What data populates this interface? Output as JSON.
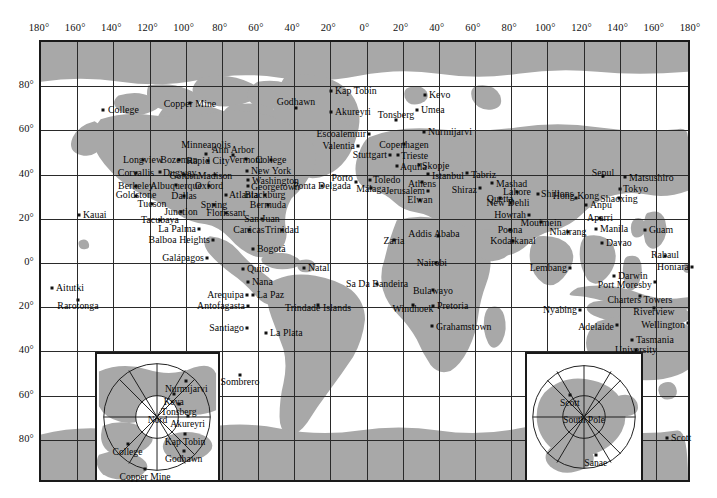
{
  "map": {
    "title": "World map of geophysical observatory stations",
    "projection": "cylindrical-equirectangular",
    "colors": {
      "land": "#a8a8a8",
      "ocean": "#ffffff",
      "grid": "#2a2a2a",
      "frame": "#1a1a1a",
      "text": "#050505"
    },
    "frame": {
      "x": 39,
      "y": 40,
      "width": 651,
      "height": 442
    },
    "longitude_ticks": [
      "180°",
      "160°",
      "140°",
      "120°",
      "100°",
      "80°",
      "60°",
      "40°",
      "20°",
      "0°",
      "20°",
      "40°",
      "60°",
      "80°",
      "100°",
      "120°",
      "140°",
      "160°",
      "180°"
    ],
    "latitude_ticks": [
      "80°",
      "60°",
      "40°",
      "20°",
      "0°",
      "20°",
      "40°",
      "60°",
      "80°"
    ],
    "grid_spacing_degrees": {
      "longitude": 20,
      "latitude": 20
    }
  },
  "stations": [
    {
      "name": "College",
      "x": 103,
      "y": 110,
      "lx": 108,
      "ly": 110,
      "align": "l"
    },
    {
      "name": "Copper Mine",
      "x": 190,
      "y": 103,
      "lx": 190,
      "ly": 104,
      "align": "c"
    },
    {
      "name": "Godhawn",
      "x": 296,
      "y": 108,
      "lx": 296,
      "ly": 102,
      "align": "c"
    },
    {
      "name": "Kap Tobin",
      "x": 331,
      "y": 91,
      "lx": 335,
      "ly": 91,
      "align": "l"
    },
    {
      "name": "Akureyri",
      "x": 331,
      "y": 112,
      "lx": 335,
      "ly": 112,
      "align": "l"
    },
    {
      "name": "Tonsberg",
      "x": 396,
      "y": 120,
      "lx": 396,
      "ly": 115,
      "align": "c"
    },
    {
      "name": "Kevo",
      "x": 425,
      "y": 95,
      "lx": 429,
      "ly": 95,
      "align": "l"
    },
    {
      "name": "Umea",
      "x": 417,
      "y": 110,
      "lx": 421,
      "ly": 110,
      "align": "l"
    },
    {
      "name": "Escoalemuir",
      "x": 369,
      "y": 134,
      "lx": 366,
      "ly": 134,
      "align": "r"
    },
    {
      "name": "Nurmijarvi",
      "x": 424,
      "y": 132,
      "lx": 428,
      "ly": 132,
      "align": "l"
    },
    {
      "name": "Valentia",
      "x": 358,
      "y": 146,
      "lx": 355,
      "ly": 146,
      "align": "r"
    },
    {
      "name": "Copenhagen",
      "x": 404,
      "y": 144,
      "lx": 404,
      "ly": 145,
      "align": "c"
    },
    {
      "name": "Stuttgart",
      "x": 390,
      "y": 155,
      "lx": 387,
      "ly": 155,
      "align": "r"
    },
    {
      "name": "Trieste",
      "x": 398,
      "y": 155,
      "lx": 401,
      "ly": 156,
      "align": "l"
    },
    {
      "name": "Aquila",
      "x": 397,
      "y": 166,
      "lx": 400,
      "ly": 167,
      "align": "l"
    },
    {
      "name": "Skopje",
      "x": 419,
      "y": 165,
      "lx": 422,
      "ly": 166,
      "align": "l"
    },
    {
      "name": "Istanbul",
      "x": 428,
      "y": 174,
      "lx": 432,
      "ly": 176,
      "align": "l"
    },
    {
      "name": "Porto",
      "x": 356,
      "y": 182,
      "lx": 353,
      "ly": 178,
      "align": "r"
    },
    {
      "name": "Toledo",
      "x": 370,
      "y": 180,
      "lx": 373,
      "ly": 180,
      "align": "l"
    },
    {
      "name": "Ponta Delgada",
      "x": 322,
      "y": 186,
      "lx": 322,
      "ly": 186,
      "align": "c"
    },
    {
      "name": "Málaga",
      "x": 371,
      "y": 188,
      "lx": 371,
      "ly": 189,
      "align": "c"
    },
    {
      "name": "Athens",
      "x": 422,
      "y": 182,
      "lx": 422,
      "ly": 184,
      "align": "c"
    },
    {
      "name": "Jerusalem",
      "x": 428,
      "y": 191,
      "lx": 425,
      "ly": 191,
      "align": "r"
    },
    {
      "name": "Elwan",
      "x": 420,
      "y": 200,
      "lx": 420,
      "ly": 200,
      "align": "c"
    },
    {
      "name": "Tabriz",
      "x": 467,
      "y": 173,
      "lx": 471,
      "ly": 175,
      "align": "l"
    },
    {
      "name": "Shiraz",
      "x": 480,
      "y": 188,
      "lx": 477,
      "ly": 190,
      "align": "r"
    },
    {
      "name": "Mashad",
      "x": 492,
      "y": 183,
      "lx": 496,
      "ly": 184,
      "align": "l"
    },
    {
      "name": "Quetta",
      "x": 500,
      "y": 198,
      "lx": 500,
      "ly": 199,
      "align": "c"
    },
    {
      "name": "Lahore",
      "x": 517,
      "y": 192,
      "lx": 517,
      "ly": 192,
      "align": "c"
    },
    {
      "name": "New Dehli",
      "x": 511,
      "y": 203,
      "lx": 508,
      "ly": 203,
      "align": "c"
    },
    {
      "name": "Shillons",
      "x": 538,
      "y": 194,
      "lx": 541,
      "ly": 194,
      "align": "l"
    },
    {
      "name": "Howrah",
      "x": 529,
      "y": 215,
      "lx": 526,
      "ly": 215,
      "align": "r"
    },
    {
      "name": "Mouimein",
      "x": 541,
      "y": 222,
      "lx": 541,
      "ly": 223,
      "align": "c"
    },
    {
      "name": "Poona",
      "x": 510,
      "y": 230,
      "lx": 510,
      "ly": 230,
      "align": "c"
    },
    {
      "name": "Kodaikanal",
      "x": 513,
      "y": 241,
      "lx": 513,
      "ly": 241,
      "align": "c"
    },
    {
      "name": "Nhatrang",
      "x": 568,
      "y": 232,
      "lx": 568,
      "ly": 232,
      "align": "c"
    },
    {
      "name": "Hong Kong",
      "x": 576,
      "y": 198,
      "lx": 576,
      "ly": 196,
      "align": "c"
    },
    {
      "name": "Anpu",
      "x": 586,
      "y": 205,
      "lx": 590,
      "ly": 205,
      "align": "l"
    },
    {
      "name": "Sepul",
      "x": 603,
      "y": 176,
      "lx": 603,
      "ly": 173,
      "align": "c"
    },
    {
      "name": "Matsushiro",
      "x": 625,
      "y": 177,
      "lx": 629,
      "ly": 178,
      "align": "l"
    },
    {
      "name": "Tokyo",
      "x": 620,
      "y": 189,
      "lx": 623,
      "ly": 189,
      "align": "l"
    },
    {
      "name": "Shaoxing",
      "x": 619,
      "y": 198,
      "lx": 619,
      "ly": 199,
      "align": "c"
    },
    {
      "name": "Aparri",
      "x": 600,
      "y": 218,
      "lx": 600,
      "ly": 218,
      "align": "c"
    },
    {
      "name": "Manila",
      "x": 596,
      "y": 229,
      "lx": 600,
      "ly": 229,
      "align": "l"
    },
    {
      "name": "Davao",
      "x": 602,
      "y": 243,
      "lx": 606,
      "ly": 243,
      "align": "l"
    },
    {
      "name": "Guam",
      "x": 645,
      "y": 230,
      "lx": 649,
      "ly": 230,
      "align": "l"
    },
    {
      "name": "Rabaul",
      "x": 665,
      "y": 256,
      "lx": 665,
      "ly": 255,
      "align": "c"
    },
    {
      "name": "Honiara",
      "x": 692,
      "y": 267,
      "lx": 689,
      "ly": 267,
      "align": "r"
    },
    {
      "name": "Lembang",
      "x": 570,
      "y": 268,
      "lx": 567,
      "ly": 268,
      "align": "r"
    },
    {
      "name": "Darwin",
      "x": 614,
      "y": 276,
      "lx": 618,
      "ly": 276,
      "align": "l"
    },
    {
      "name": "Port Moresby",
      "x": 655,
      "y": 282,
      "lx": 652,
      "ly": 285,
      "align": "r"
    },
    {
      "name": "Charters Towers",
      "x": 640,
      "y": 296,
      "lx": 640,
      "ly": 300,
      "align": "c"
    },
    {
      "name": "Nyabing",
      "x": 580,
      "y": 310,
      "lx": 577,
      "ly": 310,
      "align": "r"
    },
    {
      "name": "Riverview",
      "x": 654,
      "y": 308,
      "lx": 654,
      "ly": 312,
      "align": "c"
    },
    {
      "name": "Adelaide",
      "x": 617,
      "y": 325,
      "lx": 614,
      "ly": 327,
      "align": "r"
    },
    {
      "name": "Wellington",
      "x": 688,
      "y": 323,
      "lx": 685,
      "ly": 325,
      "align": "r"
    },
    {
      "name": "Tasmania",
      "x": 632,
      "y": 340,
      "lx": 636,
      "ly": 340,
      "align": "l"
    },
    {
      "name": "University",
      "x": 636,
      "y": 350,
      "lx": 636,
      "ly": 350,
      "align": "c"
    },
    {
      "name": "Minneapolis",
      "x": 206,
      "y": 154,
      "lx": 206,
      "ly": 145,
      "align": "c"
    },
    {
      "name": "Ann Arbor",
      "x": 233,
      "y": 155,
      "lx": 233,
      "ly": 150,
      "align": "c"
    },
    {
      "name": "Longview",
      "x": 143,
      "y": 160,
      "lx": 143,
      "ly": 160,
      "align": "c"
    },
    {
      "name": "Bozeman",
      "x": 179,
      "y": 160,
      "lx": 179,
      "ly": 160,
      "align": "c"
    },
    {
      "name": "Rapid City",
      "x": 208,
      "y": 161,
      "lx": 208,
      "ly": 161,
      "align": "c"
    },
    {
      "name": "Vermont",
      "x": 246,
      "y": 159,
      "lx": 246,
      "ly": 160,
      "align": "c"
    },
    {
      "name": "College",
      "x": 271,
      "y": 160,
      "lx": 271,
      "ly": 160,
      "align": "c"
    },
    {
      "name": "Corvallis",
      "x": 136,
      "y": 173,
      "lx": 136,
      "ly": 173,
      "align": "c"
    },
    {
      "name": "Dugway",
      "x": 160,
      "y": 172,
      "lx": 163,
      "ly": 173,
      "align": "l"
    },
    {
      "name": "Golden",
      "x": 184,
      "y": 175,
      "lx": 184,
      "ly": 176,
      "align": "c"
    },
    {
      "name": "Madison",
      "x": 215,
      "y": 175,
      "lx": 215,
      "ly": 176,
      "align": "c"
    },
    {
      "name": "New York",
      "x": 247,
      "y": 171,
      "lx": 251,
      "ly": 171,
      "align": "l"
    },
    {
      "name": "Washington",
      "x": 248,
      "y": 180,
      "lx": 252,
      "ly": 181,
      "align": "l"
    },
    {
      "name": "Berkeley",
      "x": 136,
      "y": 186,
      "lx": 136,
      "ly": 186,
      "align": "c"
    },
    {
      "name": "Albuquerque",
      "x": 176,
      "y": 185,
      "lx": 176,
      "ly": 186,
      "align": "c"
    },
    {
      "name": "Oxford",
      "x": 209,
      "y": 186,
      "lx": 209,
      "ly": 186,
      "align": "c"
    },
    {
      "name": "Georgetown",
      "x": 248,
      "y": 186,
      "lx": 251,
      "ly": 187,
      "align": "l"
    },
    {
      "name": "Goldstone",
      "x": 136,
      "y": 196,
      "lx": 136,
      "ly": 195,
      "align": "c"
    },
    {
      "name": "Dallas",
      "x": 184,
      "y": 196,
      "lx": 184,
      "ly": 196,
      "align": "c"
    },
    {
      "name": "Atlanta",
      "x": 226,
      "y": 195,
      "lx": 229,
      "ly": 195,
      "align": "l"
    },
    {
      "name": "Blackburg",
      "x": 265,
      "y": 195,
      "lx": 265,
      "ly": 195,
      "align": "c"
    },
    {
      "name": "Tucson",
      "x": 152,
      "y": 204,
      "lx": 152,
      "ly": 204,
      "align": "c"
    },
    {
      "name": "Junction",
      "x": 181,
      "y": 212,
      "lx": 181,
      "ly": 212,
      "align": "c"
    },
    {
      "name": "Spring",
      "x": 214,
      "y": 205,
      "lx": 214,
      "ly": 205,
      "align": "c"
    },
    {
      "name": "Bermuda",
      "x": 268,
      "y": 205,
      "lx": 268,
      "ly": 205,
      "align": "c"
    },
    {
      "name": "Florissant",
      "x": 226,
      "y": 213,
      "lx": 226,
      "ly": 213,
      "align": "c"
    },
    {
      "name": "San Juan",
      "x": 262,
      "y": 219,
      "lx": 262,
      "ly": 219,
      "align": "c"
    },
    {
      "name": "Tacubaya",
      "x": 160,
      "y": 220,
      "lx": 160,
      "ly": 220,
      "align": "c"
    },
    {
      "name": "Kauai",
      "x": 79,
      "y": 215,
      "lx": 83,
      "ly": 215,
      "align": "l"
    },
    {
      "name": "La Palma",
      "x": 199,
      "y": 229,
      "lx": 196,
      "ly": 229,
      "align": "r"
    },
    {
      "name": "Carácas",
      "x": 249,
      "y": 230,
      "lx": 249,
      "ly": 230,
      "align": "c"
    },
    {
      "name": "Trinidad",
      "x": 282,
      "y": 230,
      "lx": 282,
      "ly": 230,
      "align": "c"
    },
    {
      "name": "Balboa Heights",
      "x": 213,
      "y": 240,
      "lx": 210,
      "ly": 240,
      "align": "r"
    },
    {
      "name": "Bogotá",
      "x": 253,
      "y": 249,
      "lx": 257,
      "ly": 249,
      "align": "l"
    },
    {
      "name": "Galápagos",
      "x": 207,
      "y": 258,
      "lx": 204,
      "ly": 258,
      "align": "r"
    },
    {
      "name": "Quito",
      "x": 243,
      "y": 269,
      "lx": 247,
      "ly": 269,
      "align": "l"
    },
    {
      "name": "Natal",
      "x": 304,
      "y": 268,
      "lx": 308,
      "ly": 268,
      "align": "l"
    },
    {
      "name": "Sa Da Bandeira",
      "x": 377,
      "y": 284,
      "lx": 377,
      "ly": 284,
      "align": "c"
    },
    {
      "name": "Nana",
      "x": 248,
      "y": 282,
      "lx": 252,
      "ly": 282,
      "align": "l"
    },
    {
      "name": "Aitutki",
      "x": 52,
      "y": 288,
      "lx": 56,
      "ly": 288,
      "align": "l"
    },
    {
      "name": "Arequipa",
      "x": 247,
      "y": 295,
      "lx": 244,
      "ly": 295,
      "align": "r"
    },
    {
      "name": "La Paz",
      "x": 253,
      "y": 295,
      "lx": 257,
      "ly": 295,
      "align": "l"
    },
    {
      "name": "Rarotonga",
      "x": 78,
      "y": 300,
      "lx": 78,
      "ly": 306,
      "align": "c"
    },
    {
      "name": "Antofagasta",
      "x": 248,
      "y": 306,
      "lx": 245,
      "ly": 306,
      "align": "r"
    },
    {
      "name": "Trindade Islands",
      "x": 318,
      "y": 305,
      "lx": 318,
      "ly": 308,
      "align": "c"
    },
    {
      "name": "Windhoek",
      "x": 413,
      "y": 305,
      "lx": 413,
      "ly": 309,
      "align": "c"
    },
    {
      "name": "Pretoria",
      "x": 433,
      "y": 306,
      "lx": 437,
      "ly": 306,
      "align": "l"
    },
    {
      "name": "Bulawayo",
      "x": 433,
      "y": 290,
      "lx": 433,
      "ly": 291,
      "align": "c"
    },
    {
      "name": "Nairobi",
      "x": 436,
      "y": 263,
      "lx": 432,
      "ly": 263,
      "align": "c"
    },
    {
      "name": "Addis Ababa",
      "x": 438,
      "y": 236,
      "lx": 434,
      "ly": 234,
      "align": "c"
    },
    {
      "name": "Zaria",
      "x": 394,
      "y": 240,
      "lx": 394,
      "ly": 241,
      "align": "c"
    },
    {
      "name": "Grahamstown",
      "x": 432,
      "y": 326,
      "lx": 436,
      "ly": 327,
      "align": "l"
    },
    {
      "name": "Santiago",
      "x": 247,
      "y": 328,
      "lx": 244,
      "ly": 328,
      "align": "r"
    },
    {
      "name": "La Plata",
      "x": 266,
      "y": 333,
      "lx": 270,
      "ly": 333,
      "align": "l"
    },
    {
      "name": "Sombrero",
      "x": 240,
      "y": 375,
      "lx": 240,
      "ly": 382,
      "align": "c"
    },
    {
      "name": "Scott",
      "x": 667,
      "y": 438,
      "lx": 671,
      "ly": 438,
      "align": "l"
    }
  ],
  "north_inset": {
    "label": "North polar projection",
    "center_label": "Nord",
    "stations": [
      {
        "name": "Nurmijarvi",
        "x": 0.73,
        "y": 0.22
      },
      {
        "name": "Keva",
        "x": 0.63,
        "y": 0.32
      },
      {
        "name": "Tonsberg",
        "x": 0.67,
        "y": 0.4
      },
      {
        "name": "Akureyri",
        "x": 0.74,
        "y": 0.49
      },
      {
        "name": "Kap Tobin",
        "x": 0.72,
        "y": 0.63
      },
      {
        "name": "Godhawn",
        "x": 0.71,
        "y": 0.76
      },
      {
        "name": "College",
        "x": 0.26,
        "y": 0.71
      },
      {
        "name": "Copper Mine",
        "x": 0.4,
        "y": 0.9
      }
    ]
  },
  "south_inset": {
    "label": "South polar projection",
    "center_label": "South Pole",
    "stations": [
      {
        "name": "Scott",
        "x": 0.38,
        "y": 0.33
      },
      {
        "name": "Sanae",
        "x": 0.6,
        "y": 0.79
      }
    ]
  }
}
